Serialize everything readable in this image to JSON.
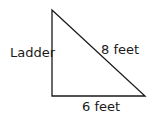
{
  "diagram": {
    "shape": "right-triangle",
    "labels": {
      "vertical_side": "Ladder",
      "hypotenuse": "8 feet",
      "base": "6 feet"
    },
    "colors": {
      "stroke": "#1a1a1a",
      "text": "#1a1a1a",
      "background": "#ffffff"
    }
  }
}
